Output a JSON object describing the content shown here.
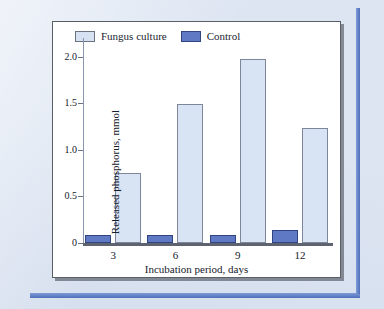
{
  "chart_data": {
    "type": "bar",
    "title": "",
    "subtitle": "",
    "xlabel": "Incubation period, days",
    "ylabel": "Released phosphorus, mmol",
    "categories": [
      "3",
      "6",
      "9",
      "12"
    ],
    "series": [
      {
        "name": "Control",
        "values": [
          0.09,
          0.09,
          0.09,
          0.14
        ],
        "color": "#5f79c4"
      },
      {
        "name": "Fungus culture",
        "values": [
          0.75,
          1.49,
          1.97,
          1.23
        ],
        "color": "#d8e3f3"
      }
    ],
    "legend": [
      "Fungus culture",
      "Control"
    ],
    "legend_position": "top-left-inside",
    "ylim": [
      0,
      2.2
    ],
    "yticks": [
      "0",
      "0.5",
      "1.0",
      "1.5",
      "2.0"
    ],
    "ytick_values": [
      0,
      0.5,
      1.0,
      1.5,
      2.0
    ],
    "grid": false,
    "axis_color": "#5d646f"
  },
  "legend": {
    "fungus_label": "Fungus culture",
    "control_label": "Control"
  },
  "axes": {
    "x_title": "Incubation period, days",
    "y_title": "Released phosphorus, mmol"
  }
}
